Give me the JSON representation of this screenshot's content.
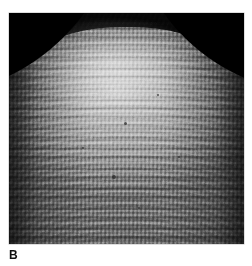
{
  "figure": {
    "panel_label": "B",
    "image_type": "scanning-electron-micrograph",
    "subject_description": "Dome-shaped specimen surface covered by a regular lattice of micro-cells arranged in curved rows",
    "background_color": "#ffffff",
    "frame": {
      "x": 9,
      "y": 13,
      "width": 235,
      "height": 231,
      "border_color": "#bdbdbd"
    },
    "palette": {
      "chamber_black": "#000000",
      "specimen_highlight": "#d8d8d8",
      "specimen_midtone": "#a9a9a9",
      "specimen_shadow": "#6f6f6f",
      "label_color": "#111111"
    },
    "specks": [
      {
        "left": "49%",
        "top": "47%",
        "size": "3px"
      },
      {
        "left": "44%",
        "top": "70%",
        "size": "4px"
      },
      {
        "left": "63%",
        "top": "35%",
        "size": "2px"
      },
      {
        "left": "31%",
        "top": "58%",
        "size": "2px"
      },
      {
        "left": "72%",
        "top": "62%",
        "size": "2px"
      },
      {
        "left": "55%",
        "top": "84%",
        "size": "2px"
      }
    ]
  }
}
